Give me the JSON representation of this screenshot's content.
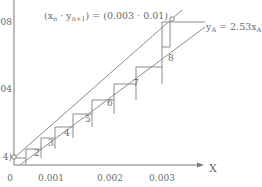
{
  "diagram": {
    "title_label": "(xₙ · yₙ₊₁) = (0.003 · 0.01)",
    "line_label": "yₐ = 2.53xₐ",
    "line_label_main": "y",
    "line_label_sub": "A",
    "line_label_eq": " = 2.53x",
    "line_label_sub2": "A",
    "title_parts": {
      "open": "(x",
      "sub_n": "n",
      "mid": " · y",
      "sub_n1": "n+1",
      "close": ") = (0.003 · 0.01)"
    },
    "x_axis": {
      "label": "X",
      "ticks": [
        "0",
        "0.001",
        "0.002",
        "0.003"
      ]
    },
    "y_axis": {
      "ticks": [
        "008",
        "004",
        "4)"
      ]
    },
    "step_labels": [
      "2",
      "3",
      "4",
      "5",
      "6",
      "7",
      "8"
    ],
    "colors": {
      "line": "#8c8c8c",
      "text": "#6a6a6a",
      "axis": "#7a7a7a"
    }
  }
}
